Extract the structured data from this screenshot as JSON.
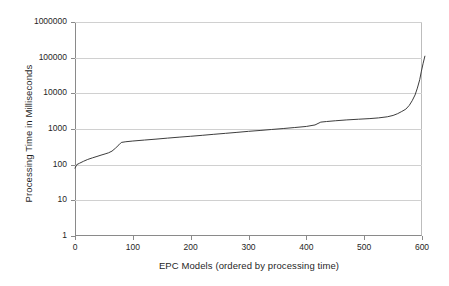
{
  "chart_data": {
    "type": "line",
    "title": "",
    "xlabel": "EPC Models (ordered by processing time)",
    "ylabel": "Processing Time in Milliseconds",
    "xlim": [
      0,
      600
    ],
    "ylim": [
      1,
      1000000
    ],
    "yscale": "log",
    "xscale": "linear",
    "grid": "horizontal",
    "legend": "none",
    "xticks": [
      0,
      100,
      200,
      300,
      400,
      500,
      600
    ],
    "xtick_labels": [
      "0",
      "100",
      "200",
      "300",
      "400",
      "500",
      "600"
    ],
    "yticks": [
      1,
      10,
      100,
      1000,
      10000,
      100000,
      1000000
    ],
    "ytick_labels": [
      "1",
      "10",
      "100",
      "1000",
      "10000",
      "100000",
      "1000000"
    ],
    "series": [
      {
        "name": "Processing time",
        "color": "#3d3d3d",
        "x": [
          0,
          3,
          8,
          15,
          22,
          30,
          38,
          45,
          52,
          58,
          64,
          70,
          76,
          80,
          88,
          100,
          120,
          140,
          160,
          180,
          200,
          220,
          240,
          260,
          280,
          300,
          320,
          340,
          360,
          380,
          400,
          415,
          425,
          435,
          450,
          470,
          490,
          510,
          525,
          540,
          550,
          558,
          565,
          572,
          578,
          583,
          588,
          592,
          596,
          599,
          602,
          605
        ],
        "y": [
          80,
          100,
          110,
          125,
          140,
          155,
          170,
          185,
          200,
          215,
          240,
          290,
          360,
          420,
          440,
          460,
          490,
          520,
          555,
          590,
          625,
          665,
          710,
          755,
          805,
          860,
          910,
          970,
          1030,
          1100,
          1180,
          1300,
          1560,
          1620,
          1700,
          1800,
          1880,
          1960,
          2050,
          2200,
          2400,
          2700,
          3100,
          3600,
          4600,
          6200,
          9000,
          14000,
          24000,
          42000,
          70000,
          110000
        ]
      }
    ]
  },
  "axes": {
    "y_title": "Processing Time in Milliseconds",
    "x_title": "EPC Models (ordered by processing time)"
  }
}
